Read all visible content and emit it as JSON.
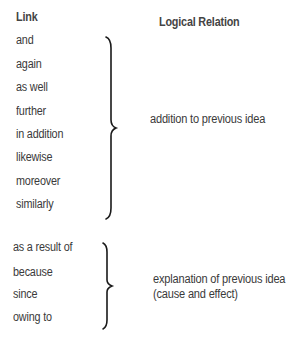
{
  "headers": {
    "link": "Link",
    "relation": "Logical Relation"
  },
  "groups": [
    {
      "links": [
        "and",
        "again",
        "as well",
        "further",
        "in addition",
        "likewise",
        "moreover",
        "similarly"
      ],
      "relation_lines": [
        "addition to previous idea"
      ]
    },
    {
      "links": [
        "as a result of",
        "because",
        "since",
        "owing to"
      ],
      "relation_lines": [
        "explanation of previous idea",
        "(cause and effect)"
      ]
    }
  ],
  "colors": {
    "text": "#3a3a3a",
    "brace": "#1a1a1a",
    "background": "#ffffff"
  }
}
